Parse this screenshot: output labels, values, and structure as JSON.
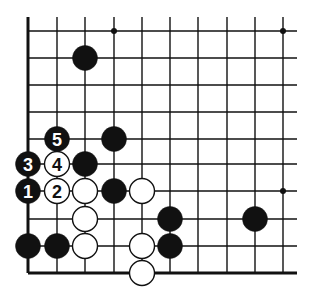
{
  "diagram": {
    "type": "go-board-fragment",
    "grid": {
      "cols_x": [
        28,
        57,
        85,
        114,
        142,
        170,
        198,
        227,
        255,
        283
      ],
      "rows_y": [
        31,
        58,
        85,
        112,
        139,
        164,
        191,
        219,
        246,
        273
      ],
      "extend_top": 17,
      "extend_right": 297,
      "edges": [
        "left",
        "bottom"
      ]
    },
    "star_points": [
      [
        3,
        0
      ],
      [
        9,
        0
      ],
      [
        9,
        6
      ]
    ],
    "stones": [
      {
        "c": 2,
        "r": 1,
        "color": "black",
        "label": ""
      },
      {
        "c": 1,
        "r": 4,
        "color": "black",
        "label": "5"
      },
      {
        "c": 3,
        "r": 4,
        "color": "black",
        "label": ""
      },
      {
        "c": 0,
        "r": 5,
        "color": "black",
        "label": "3"
      },
      {
        "c": 1,
        "r": 5,
        "color": "white",
        "label": "4"
      },
      {
        "c": 2,
        "r": 5,
        "color": "black",
        "label": ""
      },
      {
        "c": 0,
        "r": 6,
        "color": "black",
        "label": "1"
      },
      {
        "c": 1,
        "r": 6,
        "color": "white",
        "label": "2"
      },
      {
        "c": 2,
        "r": 6,
        "color": "white",
        "label": ""
      },
      {
        "c": 3,
        "r": 6,
        "color": "black",
        "label": ""
      },
      {
        "c": 4,
        "r": 6,
        "color": "white",
        "label": ""
      },
      {
        "c": 2,
        "r": 7,
        "color": "white",
        "label": ""
      },
      {
        "c": 5,
        "r": 7,
        "color": "black",
        "label": ""
      },
      {
        "c": 8,
        "r": 7,
        "color": "black",
        "label": ""
      },
      {
        "c": 0,
        "r": 8,
        "color": "black",
        "label": ""
      },
      {
        "c": 1,
        "r": 8,
        "color": "black",
        "label": ""
      },
      {
        "c": 2,
        "r": 8,
        "color": "white",
        "label": ""
      },
      {
        "c": 4,
        "r": 8,
        "color": "white",
        "label": ""
      },
      {
        "c": 5,
        "r": 8,
        "color": "black",
        "label": ""
      },
      {
        "c": 4,
        "r": 9,
        "color": "white",
        "label": ""
      }
    ]
  }
}
